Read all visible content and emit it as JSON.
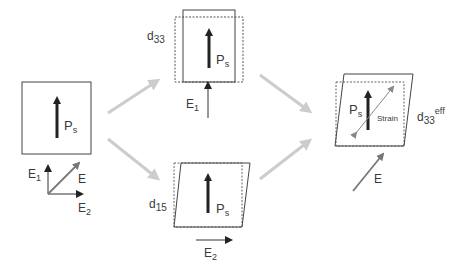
{
  "diagram": {
    "initial": {
      "polarization_label": "P",
      "polarization_sub": "s",
      "axes": {
        "e1": "E",
        "e1_sub": "1",
        "e2": "E",
        "e2_sub": "2",
        "e": "E"
      }
    },
    "top_path": {
      "coefficient": "d",
      "coefficient_sub": "33",
      "polarization_label": "P",
      "polarization_sub": "s",
      "field": "E",
      "field_sub": "1"
    },
    "bottom_path": {
      "coefficient": "d",
      "coefficient_sub": "15",
      "polarization_label": "P",
      "polarization_sub": "s",
      "field": "E",
      "field_sub": "2"
    },
    "result": {
      "polarization_label": "P",
      "polarization_sub": "s",
      "strain_label": "Strain",
      "coefficient": "d",
      "coefficient_sub": "33",
      "coefficient_sup": "eff",
      "field": "E"
    },
    "colors": {
      "line": "#333333",
      "arrow_dark": "#222222",
      "flow_arrow": "#cccccc",
      "field_arrow": "#777777",
      "dashed": "#888888"
    }
  }
}
